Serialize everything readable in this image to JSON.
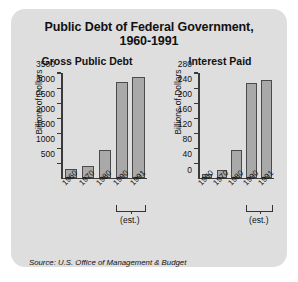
{
  "title_line1": "Public Debt of Federal Government,",
  "title_line2": "1960-1991",
  "source": "Source: U.S. Office of Management & Budget",
  "est_label": "(est.)",
  "chart_data": [
    {
      "type": "bar",
      "title": "Gross Public Debt",
      "xlabel": "",
      "ylabel": "Billions of Dollars",
      "categories": [
        "1960",
        "1970",
        "1980",
        "1990",
        "1991"
      ],
      "values": [
        290,
        380,
        910,
        3200,
        3350
      ],
      "ylim": [
        0,
        3500
      ],
      "yticks": [
        0,
        500,
        1000,
        1500,
        2000,
        2500,
        3000,
        3500
      ],
      "ytick_labels": [
        "",
        "500",
        "1000",
        "1500",
        "2000",
        "2500",
        "3000",
        "3500"
      ],
      "grid": false,
      "legend": "none",
      "annotation": "(est.)",
      "annotation_span": [
        "1990",
        "1991"
      ]
    },
    {
      "type": "bar",
      "title": "Interest Paid",
      "xlabel": "",
      "ylabel": "Billions of Dollars",
      "categories": [
        "1960",
        "1970",
        "1980",
        "1990",
        "1991"
      ],
      "values": [
        9,
        19,
        75,
        252,
        260
      ],
      "ylim": [
        0,
        280
      ],
      "yticks": [
        0,
        40,
        80,
        120,
        160,
        200,
        240,
        280
      ],
      "ytick_labels": [
        "0",
        "40",
        "80",
        "120",
        "160",
        "200",
        "240",
        "280"
      ],
      "grid": false,
      "legend": "none",
      "annotation": "(est.)",
      "annotation_span": [
        "1990",
        "1991"
      ]
    }
  ],
  "colors": {
    "panel": "#dedede",
    "bar_fill": "#a9a9a9",
    "bar_stroke": "#4a4a4a",
    "axis": "#3a3a3a",
    "text": "#111111"
  }
}
